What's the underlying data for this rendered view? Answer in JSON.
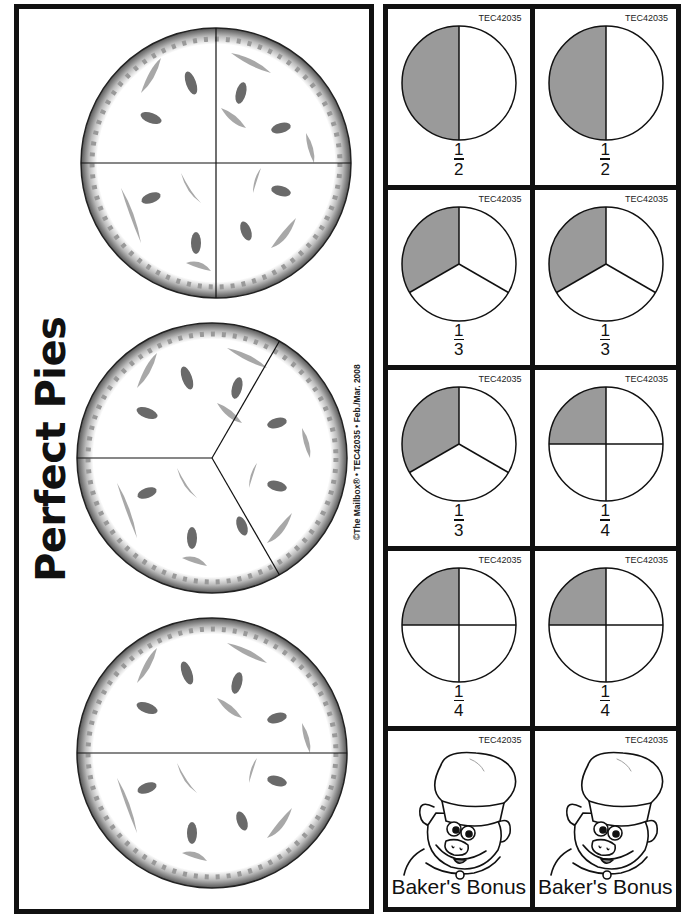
{
  "title": "Perfect Pies",
  "credit": "©The Mailbox® • TEC42035 • Feb./Mar. 2008",
  "big_pies": [
    {
      "name": "pie-fourths",
      "slices": 4
    },
    {
      "name": "pie-thirds",
      "slices": 3
    },
    {
      "name": "pie-halves",
      "slices": 2
    }
  ],
  "cards": [
    {
      "code": "TEC42035",
      "type": "fraction",
      "numerator": "1",
      "denominator": "2"
    },
    {
      "code": "TEC42035",
      "type": "fraction",
      "numerator": "1",
      "denominator": "2"
    },
    {
      "code": "TEC42035",
      "type": "fraction",
      "numerator": "1",
      "denominator": "3"
    },
    {
      "code": "TEC42035",
      "type": "fraction",
      "numerator": "1",
      "denominator": "3"
    },
    {
      "code": "TEC42035",
      "type": "fraction",
      "numerator": "1",
      "denominator": "3"
    },
    {
      "code": "TEC42035",
      "type": "fraction",
      "numerator": "1",
      "denominator": "4"
    },
    {
      "code": "TEC42035",
      "type": "fraction",
      "numerator": "1",
      "denominator": "4"
    },
    {
      "code": "TEC42035",
      "type": "fraction",
      "numerator": "1",
      "denominator": "4"
    },
    {
      "code": "TEC42035",
      "type": "bonus",
      "label": "Baker's Bonus"
    },
    {
      "code": "TEC42035",
      "type": "bonus",
      "label": "Baker's Bonus"
    }
  ],
  "colors": {
    "shade": "#9a9a9a",
    "border": "#111111",
    "crust": "#7a7a7a"
  }
}
